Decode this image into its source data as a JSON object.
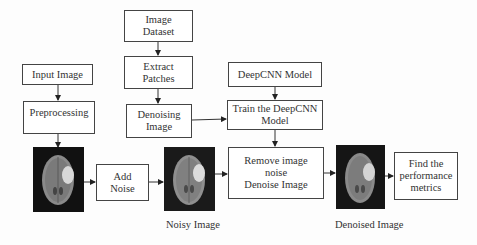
{
  "diagram": {
    "nodes": {
      "image_dataset": {
        "lines": [
          "Image",
          "Dataset"
        ]
      },
      "extract_patches": {
        "lines": [
          "Extract",
          "Patches"
        ]
      },
      "denoising_image": {
        "lines": [
          "Denoising",
          "Image"
        ]
      },
      "input_image": {
        "lines": [
          "Input Image"
        ]
      },
      "preprocessing": {
        "lines": [
          "Preprocessing"
        ]
      },
      "deepcnn_model": {
        "lines": [
          "DeepCNN Model"
        ]
      },
      "train_model": {
        "lines": [
          "Train the DeepCNN",
          "Model"
        ]
      },
      "add_noise": {
        "lines": [
          "Add",
          "Noise"
        ]
      },
      "remove_noise": {
        "lines": [
          "Remove image",
          "noise",
          "Denoise Image"
        ]
      },
      "find_metrics": {
        "lines": [
          "Find the",
          "performance",
          "metrics"
        ]
      }
    },
    "images": {
      "original": {
        "icon": "brain-mri-image"
      },
      "noisy": {
        "icon": "brain-mri-image",
        "caption": "Noisy Image"
      },
      "denoised": {
        "icon": "brain-mri-image",
        "caption": "Denoised Image"
      }
    },
    "edges": [
      [
        "Image Dataset",
        "Extract Patches"
      ],
      [
        "Extract Patches",
        "Denoising Image"
      ],
      [
        "Denoising Image",
        "Train the DeepCNN Model"
      ],
      [
        "DeepCNN Model",
        "Train the DeepCNN Model"
      ],
      [
        "Train the DeepCNN Model",
        "Remove image noise Denoise Image"
      ],
      [
        "Input Image",
        "Preprocessing"
      ],
      [
        "Preprocessing",
        "Original Image"
      ],
      [
        "Original Image",
        "Add Noise"
      ],
      [
        "Add Noise",
        "Noisy Image"
      ],
      [
        "Noisy Image",
        "Remove image noise Denoise Image"
      ],
      [
        "Remove image noise Denoise Image",
        "Denoised Image"
      ],
      [
        "Denoised Image",
        "Find the performance metrics"
      ]
    ]
  }
}
